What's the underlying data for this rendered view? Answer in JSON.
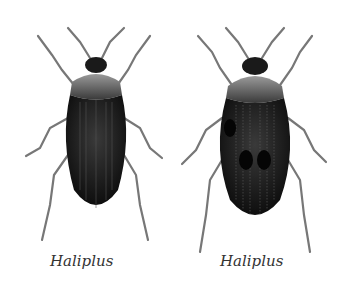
{
  "figure": {
    "colors": {
      "body": "#151515",
      "pronotum": "#6a6a6a",
      "legs": "#8a8a8a",
      "background": "#ffffff"
    },
    "specimens": [
      {
        "caption": "Haliplus",
        "markings": "striated elytra"
      },
      {
        "caption": "Haliplus",
        "markings": "spotted, punctate elytra"
      }
    ]
  }
}
